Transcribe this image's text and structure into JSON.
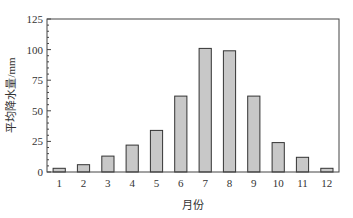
{
  "chart_data": {
    "type": "bar",
    "title": "",
    "xlabel": "月份",
    "ylabel": "平均降水量/mm",
    "categories": [
      "1",
      "2",
      "3",
      "4",
      "5",
      "6",
      "7",
      "8",
      "9",
      "10",
      "11",
      "12"
    ],
    "values": [
      3,
      6,
      13,
      22,
      34,
      62,
      101,
      99,
      62,
      24,
      12,
      3
    ],
    "ylim": [
      0,
      125
    ],
    "yticks": [
      0,
      25,
      50,
      75,
      100,
      125
    ],
    "grid": false,
    "legend": null,
    "bar_color": "#c8c8c8",
    "bar_edge_color": "#333333"
  }
}
